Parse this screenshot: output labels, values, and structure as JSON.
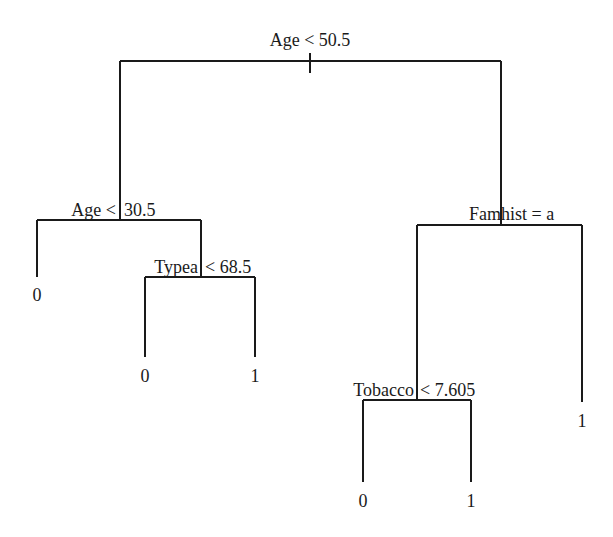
{
  "diagram": {
    "type": "decision-tree",
    "line_color": "#1a1a1a",
    "background": "#ffffff",
    "nodes": {
      "root": {
        "split": "Age < 50.5"
      },
      "left": {
        "split_left": "Age <",
        "split_right": "30.5"
      },
      "left_r": {
        "split_left": "Typea",
        "split_right": "< 68.5"
      },
      "right": {
        "split_left": "Fam",
        "split_right": "hist = a"
      },
      "right_l": {
        "split_left": "Tobacco",
        "split_right": "< 7.605"
      }
    },
    "leaves": {
      "age_lt_30_5": "0",
      "typea_lt_68_5": "0",
      "typea_ge_68_5": "1",
      "tobacco_lt_7_605": "0",
      "tobacco_ge_7_605": "1",
      "famhist_not_a": "1"
    }
  }
}
